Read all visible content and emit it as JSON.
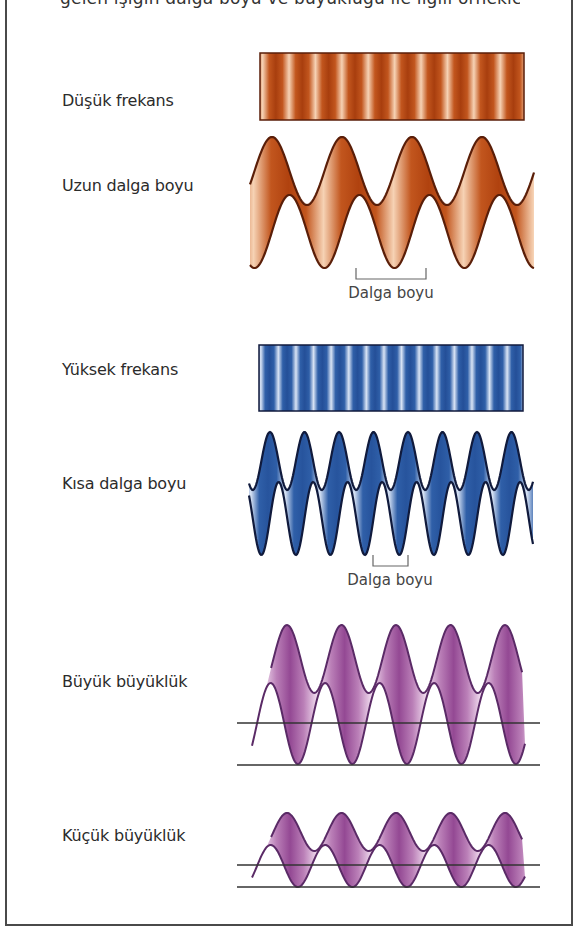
{
  "title_partial": "gelen ışığın dalga boyu ve büyüklüğü ile ilgili örnekler",
  "sections": [
    {
      "id": "low-frequency",
      "freq_label": "Düşük frekans",
      "wavelength_label": "Uzun dalga boyu",
      "wavelength_marker": "Dalga boyu",
      "color_dark": "#5a1e08",
      "color_mid": "#c2561e",
      "color_light": "#f6d2b4",
      "bar": {
        "x": 260,
        "y": 53,
        "w": 264,
        "h": 67,
        "stripes": 10
      },
      "ribbon": {
        "x0": 250,
        "x1": 534,
        "period": 70,
        "top_peak": 137,
        "top_trough": 205,
        "bot_peak": 195,
        "bot_trough": 268,
        "phase_x": 272
      },
      "bracket": {
        "x1": 356,
        "x2": 426,
        "y1": 268,
        "y2": 279
      },
      "marker_pos": {
        "x": 391,
        "y": 286
      }
    },
    {
      "id": "high-frequency",
      "freq_label": "Yüksek frekans",
      "wavelength_label": "Kısa dalga boyu",
      "wavelength_marker": "Dalga boyu",
      "color_dark": "#101a3c",
      "color_mid": "#2f5fa8",
      "color_light": "#d9e4f5",
      "bar": {
        "x": 259,
        "y": 345,
        "w": 264,
        "h": 66,
        "stripes": 15
      },
      "ribbon": {
        "x0": 249,
        "x1": 533,
        "period": 34.5,
        "top_peak": 432,
        "top_trough": 490,
        "bot_peak": 482,
        "bot_trough": 555,
        "phase_x": 270
      },
      "bracket": {
        "x1": 373,
        "x2": 408,
        "y1": 555,
        "y2": 566
      },
      "marker_pos": {
        "x": 390,
        "y": 572
      }
    }
  ],
  "amplitude_sections": [
    {
      "id": "large-amplitude",
      "label": "Büyük büyüklük",
      "ribbon": {
        "x0": 252,
        "x1": 525,
        "period": 54.5,
        "top_peak": 625,
        "top_trough": 693,
        "bot_peak": 683,
        "bot_trough": 764,
        "phase_x": 287,
        "baseline": 723
      },
      "lines": [
        {
          "y": 723,
          "x1": 237,
          "x2": 540
        },
        {
          "y": 765,
          "x1": 237,
          "x2": 540
        }
      ]
    },
    {
      "id": "small-amplitude",
      "label": "Küçük büyüklük",
      "ribbon": {
        "x0": 252,
        "x1": 525,
        "period": 54.5,
        "top_peak": 813,
        "top_trough": 851,
        "bot_peak": 845,
        "bot_trough": 887,
        "phase_x": 287,
        "baseline": 865
      },
      "lines": [
        {
          "y": 865,
          "x1": 237,
          "x2": 540
        },
        {
          "y": 887,
          "x1": 237,
          "x2": 540
        }
      ]
    }
  ],
  "label_positions": {
    "freq_low": 100,
    "wl_long": 185,
    "freq_high": 368,
    "wl_short": 483,
    "amp_large": 680,
    "amp_small": 835
  },
  "colors": {
    "purple_dark": "#5a2a66",
    "purple_mid": "#8e3f8e",
    "purple_light": "#f1dcef",
    "line": "#333333",
    "label_text": "#2b2b2b",
    "frame": "#4a4a4a"
  }
}
